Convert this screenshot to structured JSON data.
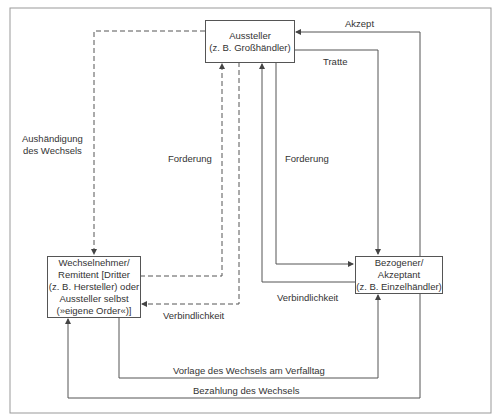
{
  "nodes": {
    "aussteller": [
      "Aussteller",
      "(z. B. Großhändler)"
    ],
    "bezogener": [
      "Bezogener/",
      "Akzeptant",
      "(z. B. Einzelhändler)"
    ],
    "wechselnehmer": [
      "Wechselnehmer/",
      "Remittent [Dritter",
      "(z. B. Hersteller) oder",
      "Aussteller selbst",
      "(»eigene Order«)]"
    ]
  },
  "edges": {
    "akzept": "Akzept",
    "tratte": "Tratte",
    "aushaendigung": [
      "Aushändigung",
      "des Wechsels"
    ],
    "forderung_left": "Forderung",
    "forderung_right": "Forderung",
    "verbindlichkeit_left": "Verbindlichkeit",
    "verbindlichkeit_right": "Verbindlichkeit",
    "vorlage": "Vorlage des Wechsels am Verfalltag",
    "bezahlung": "Bezahlung des Wechsels"
  },
  "colors": {
    "line": "#555555",
    "text": "#333333"
  }
}
